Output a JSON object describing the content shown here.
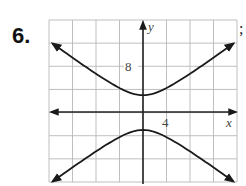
{
  "problem": {
    "number_label": "6.",
    "trailing_punct": ";"
  },
  "chart_data": {
    "type": "line",
    "title": "",
    "xlabel": "x",
    "ylabel": "y",
    "tick_labels": {
      "x": [
        "4"
      ],
      "y": [
        "8"
      ]
    },
    "grid": true,
    "grid_step": 4,
    "xlim": [
      -16,
      16
    ],
    "ylim": [
      -12,
      16
    ],
    "series": [
      {
        "name": "upper branch",
        "x": [
          -16,
          -12,
          -8,
          -4,
          0,
          4,
          8,
          12,
          16
        ],
        "y": [
          12.4,
          9.5,
          6.4,
          3.8,
          3.0,
          3.8,
          6.4,
          9.5,
          12.4
        ]
      },
      {
        "name": "lower branch",
        "x": [
          -16,
          -12,
          -8,
          -4,
          0,
          4,
          8,
          12,
          16
        ],
        "y": [
          -12.4,
          -9.5,
          -6.4,
          -3.8,
          -3.0,
          -3.8,
          -6.4,
          -9.5,
          -12.4
        ]
      }
    ],
    "annotations": [
      "vertices at (0, 3) and (0, -3)",
      "arrows at branch ends"
    ]
  },
  "colors": {
    "grid": "#b8b8b8",
    "axis": "#222222",
    "curve": "#1a1a1a"
  }
}
